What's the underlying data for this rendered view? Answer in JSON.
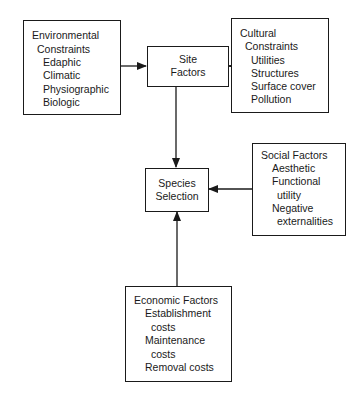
{
  "diagram": {
    "environmental": {
      "lines": [
        "Environmental",
        "Constraints",
        "Edaphic",
        "Climatic",
        "Physiographic",
        "Biologic"
      ]
    },
    "site_factors": {
      "lines": [
        "Site",
        "Factors"
      ]
    },
    "cultural": {
      "lines": [
        "Cultural",
        "Constraints",
        "Utilities",
        "Structures",
        "Surface cover",
        "Pollution"
      ]
    },
    "social": {
      "lines": [
        "Social Factors",
        "Aesthetic",
        "Functional",
        "utility",
        "Negative",
        "externalities"
      ]
    },
    "species_selection": {
      "lines": [
        "Species",
        "Selection"
      ]
    },
    "economic": {
      "lines": [
        "Economic Factors",
        "Establishment",
        "costs",
        "Maintenance",
        "costs",
        "Removal costs"
      ]
    },
    "edges": [
      {
        "from": "environmental",
        "to": "site_factors"
      },
      {
        "from": "cultural",
        "to": "site_factors"
      },
      {
        "from": "site_factors",
        "to": "species_selection"
      },
      {
        "from": "social",
        "to": "species_selection"
      },
      {
        "from": "economic",
        "to": "species_selection"
      }
    ],
    "colors": {
      "stroke": "#1a1a1a",
      "background": "#ffffff"
    }
  }
}
